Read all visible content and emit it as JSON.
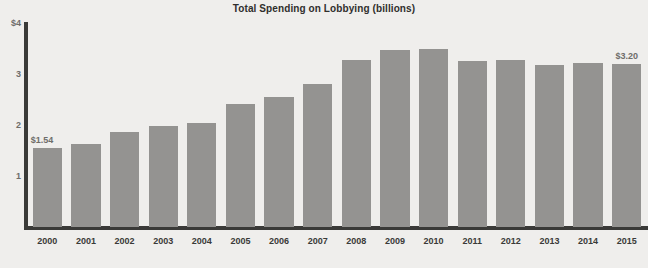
{
  "chart_data": {
    "type": "bar",
    "title": "Total Spending on Lobbying (billions)",
    "xlabel": "",
    "ylabel": "",
    "ylim": [
      0,
      4
    ],
    "grid": false,
    "legend": null,
    "y_ticks": [
      "$4",
      "3",
      "2",
      "1"
    ],
    "y_tick_values": [
      4,
      3,
      2,
      1
    ],
    "categories": [
      "2000",
      "2001",
      "2002",
      "2003",
      "2004",
      "2005",
      "2006",
      "2007",
      "2008",
      "2009",
      "2010",
      "2011",
      "2012",
      "2013",
      "2014",
      "2015"
    ],
    "values": [
      1.54,
      1.63,
      1.86,
      1.99,
      2.04,
      2.41,
      2.55,
      2.81,
      3.27,
      3.47,
      3.5,
      3.25,
      3.28,
      3.17,
      3.22,
      3.2
    ],
    "annotations": [
      {
        "category": "2000",
        "text": "$1.54",
        "position": "above-left"
      },
      {
        "category": "2015",
        "text": "$3.20",
        "position": "above"
      }
    ],
    "bar_color": "#949391",
    "axis_color": "#3a3a38",
    "background_color": "#efeeec",
    "title_color": "#302f2d",
    "tick_label_color": "#3a3a38",
    "annotation_color": "#6e6d6a"
  }
}
